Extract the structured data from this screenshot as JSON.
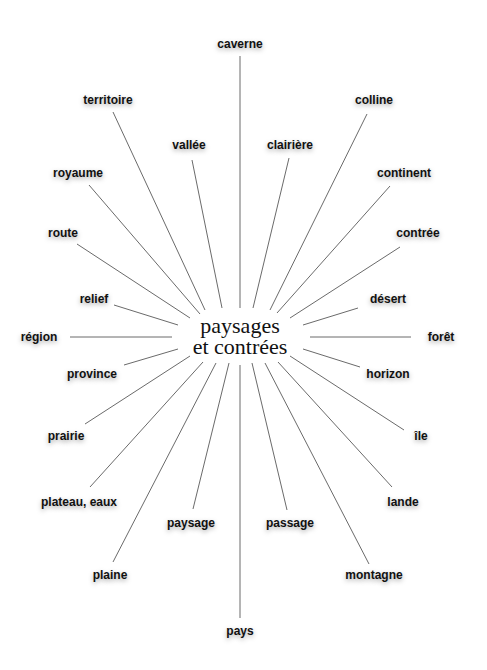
{
  "center": {
    "line1": "paysages",
    "line2": "et contrées"
  },
  "nodes": [
    {
      "label": "caverne",
      "x": 240,
      "y": 44
    },
    {
      "label": "territoire",
      "x": 108,
      "y": 100
    },
    {
      "label": "vallée",
      "x": 189,
      "y": 145
    },
    {
      "label": "clairière",
      "x": 290,
      "y": 145
    },
    {
      "label": "colline",
      "x": 374,
      "y": 100
    },
    {
      "label": "royaume",
      "x": 78,
      "y": 173
    },
    {
      "label": "continent",
      "x": 404,
      "y": 173
    },
    {
      "label": "route",
      "x": 63,
      "y": 233
    },
    {
      "label": "contrée",
      "x": 418,
      "y": 233
    },
    {
      "label": "relief",
      "x": 94,
      "y": 299
    },
    {
      "label": "désert",
      "x": 388,
      "y": 299
    },
    {
      "label": "région",
      "x": 39,
      "y": 337
    },
    {
      "label": "forêt",
      "x": 441,
      "y": 337
    },
    {
      "label": "province",
      "x": 92,
      "y": 374
    },
    {
      "label": "horizon",
      "x": 388,
      "y": 374
    },
    {
      "label": "prairie",
      "x": 66,
      "y": 436
    },
    {
      "label": "île",
      "x": 421,
      "y": 436
    },
    {
      "label": "plateau, eaux",
      "x": 79,
      "y": 502
    },
    {
      "label": "lande",
      "x": 403,
      "y": 502
    },
    {
      "label": "paysage",
      "x": 191,
      "y": 523
    },
    {
      "label": "passage",
      "x": 290,
      "y": 523
    },
    {
      "label": "plaine",
      "x": 110,
      "y": 575
    },
    {
      "label": "montagne",
      "x": 374,
      "y": 575
    },
    {
      "label": "pays",
      "x": 240,
      "y": 631
    }
  ],
  "edges": [
    [
      240,
      56,
      240,
      308
    ],
    [
      113,
      112,
      205,
      310
    ],
    [
      192,
      160,
      222,
      308
    ],
    [
      289,
      158,
      253,
      308
    ],
    [
      367,
      114,
      270,
      310
    ],
    [
      89,
      185,
      200,
      314
    ],
    [
      390,
      186,
      277,
      313
    ],
    [
      77,
      244,
      190,
      318
    ],
    [
      400,
      247,
      290,
      318
    ],
    [
      114,
      305,
      178,
      325
    ],
    [
      358,
      308,
      303,
      325
    ],
    [
      70,
      337,
      172,
      337
    ],
    [
      411,
      337,
      310,
      337
    ],
    [
      124,
      365,
      178,
      349
    ],
    [
      360,
      367,
      303,
      349
    ],
    [
      85,
      424,
      190,
      356
    ],
    [
      404,
      430,
      290,
      356
    ],
    [
      90,
      487,
      203,
      362
    ],
    [
      392,
      487,
      278,
      362
    ],
    [
      113,
      562,
      216,
      363
    ],
    [
      369,
      564,
      265,
      363
    ],
    [
      193,
      509,
      229,
      363
    ],
    [
      287,
      510,
      252,
      363
    ],
    [
      240,
      618,
      240,
      365
    ]
  ]
}
